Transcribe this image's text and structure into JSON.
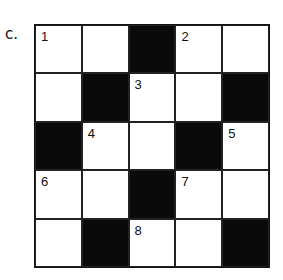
{
  "label": "c.",
  "grid": {
    "rows": 5,
    "cols": 5,
    "cells": [
      [
        {
          "type": "white",
          "num": "1"
        },
        {
          "type": "white",
          "num": ""
        },
        {
          "type": "black",
          "num": ""
        },
        {
          "type": "white",
          "num": "2"
        },
        {
          "type": "white",
          "num": ""
        }
      ],
      [
        {
          "type": "white",
          "num": ""
        },
        {
          "type": "black",
          "num": ""
        },
        {
          "type": "white",
          "num": "3"
        },
        {
          "type": "white",
          "num": ""
        },
        {
          "type": "black",
          "num": ""
        }
      ],
      [
        {
          "type": "black",
          "num": ""
        },
        {
          "type": "white",
          "num": "4"
        },
        {
          "type": "white",
          "num": ""
        },
        {
          "type": "black",
          "num": ""
        },
        {
          "type": "white",
          "num": "5"
        }
      ],
      [
        {
          "type": "white",
          "num": "6"
        },
        {
          "type": "white",
          "num": ""
        },
        {
          "type": "black",
          "num": ""
        },
        {
          "type": "white",
          "num": "7"
        },
        {
          "type": "white",
          "num": ""
        }
      ],
      [
        {
          "type": "white",
          "num": ""
        },
        {
          "type": "black",
          "num": ""
        },
        {
          "type": "white",
          "num": "8"
        },
        {
          "type": "white",
          "num": ""
        },
        {
          "type": "black",
          "num": ""
        }
      ]
    ]
  }
}
